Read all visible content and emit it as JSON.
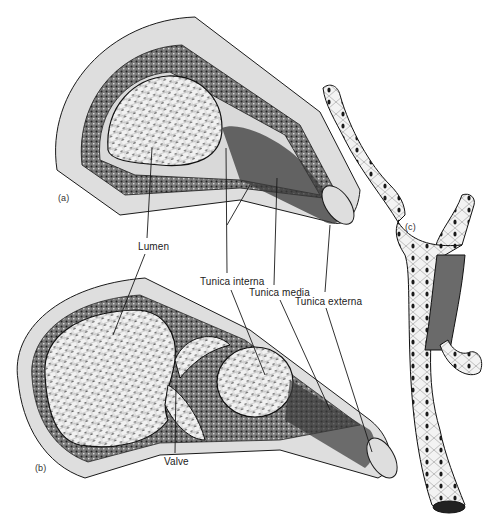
{
  "figure": {
    "panels": [
      {
        "id": "a",
        "label": "(a)",
        "subject": "artery cross-section"
      },
      {
        "id": "b",
        "label": "(b)",
        "subject": "vein cross-section"
      },
      {
        "id": "c",
        "label": "(c)",
        "subject": "capillary"
      }
    ],
    "labels": {
      "lumen": "Lumen",
      "tunica_interna": "Tunica interna",
      "tunica_media": "Tunica media",
      "tunica_externa": "Tunica externa",
      "valve": "Valve"
    },
    "colors": {
      "ink": "#1a1a1a",
      "paper": "#ffffff",
      "tissue_light": "#ebebeb",
      "tissue_mid": "#bdbdbd",
      "tissue_dark": "#555555"
    }
  }
}
